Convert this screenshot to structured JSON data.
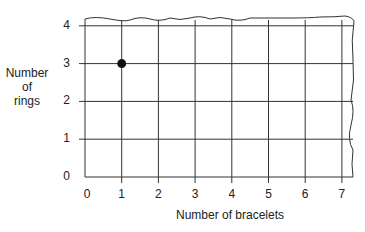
{
  "chart_data": {
    "type": "scatter",
    "title": "",
    "xlabel": "Number of bracelets",
    "ylabel": "Number of rings",
    "ylabel_lines": [
      "Number",
      "of",
      "rings"
    ],
    "x_ticks": [
      "0",
      "1",
      "2",
      "3",
      "4",
      "5",
      "6",
      "7"
    ],
    "y_ticks": [
      "0",
      "1",
      "2",
      "3",
      "4"
    ],
    "xlim": [
      0,
      7
    ],
    "ylim": [
      0,
      4
    ],
    "grid": true,
    "series": [
      {
        "name": "points",
        "points": [
          {
            "x": 1,
            "y": 3
          }
        ]
      }
    ]
  }
}
